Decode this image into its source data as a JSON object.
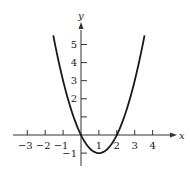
{
  "chart_data": {
    "type": "line",
    "title": "",
    "xlabel": "x",
    "ylabel": "y",
    "function": "y = x^2 - 2x",
    "xlim": [
      -3.5,
      5
    ],
    "ylim": [
      -1.7,
      6
    ],
    "grid": false,
    "legend": null,
    "x_ticks": [
      -3,
      -2,
      -1,
      1,
      2,
      3,
      4
    ],
    "x_tick_labels": [
      "−3",
      "−2",
      "−1",
      "1",
      "2",
      "3",
      "4"
    ],
    "y_ticks": [
      -1,
      1,
      2,
      3,
      4,
      5
    ],
    "y_tick_labels": [
      "−1",
      "",
      "2",
      "3",
      "4",
      "5"
    ],
    "series": [
      {
        "name": "parabola",
        "x": [
          -1.55,
          -1,
          -0.5,
          0,
          0.5,
          1,
          1.5,
          2,
          2.5,
          3,
          3.55
        ],
        "y": [
          5.5,
          3,
          1.25,
          0,
          -0.75,
          -1,
          -0.75,
          0,
          1.25,
          3,
          5.5
        ]
      }
    ],
    "key_points": {
      "roots": [
        0,
        2
      ],
      "vertex": [
        1,
        -1
      ]
    },
    "colors": {
      "curve": "#1a1a1a",
      "axes": "#333333"
    }
  }
}
